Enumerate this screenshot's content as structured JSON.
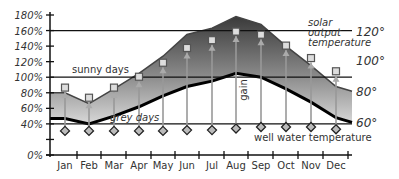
{
  "chart_data": {
    "type": "area",
    "title": "",
    "xlabel": "",
    "ylabel": "",
    "categories": [
      "Jan",
      "Feb",
      "Mar",
      "Apr",
      "May",
      "Jun",
      "Jul",
      "Aug",
      "Sep",
      "Oct",
      "Nov",
      "Dec"
    ],
    "ylim": [
      0,
      180
    ],
    "yticks": [
      "0%",
      "40%",
      "60%",
      "80%",
      "100%",
      "120%",
      "140%",
      "160%",
      "180%"
    ],
    "right_axis_ticks": [
      "60°",
      "80°",
      "100°",
      "120°"
    ],
    "series": [
      {
        "name": "sunny days",
        "values": [
          80,
          66,
          85,
          105,
          127,
          155,
          163,
          178,
          168,
          140,
          115,
          88
        ]
      },
      {
        "name": "grey days",
        "values": [
          47,
          40,
          50,
          62,
          76,
          88,
          95,
          105,
          100,
          85,
          68,
          48
        ]
      },
      {
        "name": "solar output temperature",
        "values": [
          86,
          73,
          86,
          100,
          118,
          137,
          147,
          158,
          154,
          140,
          124,
          107
        ]
      },
      {
        "name": "well water temperature",
        "values": [
          31,
          31,
          31,
          31,
          31,
          32,
          32,
          34,
          36,
          36,
          36,
          33
        ]
      }
    ],
    "reference_lines": [
      160,
      100,
      40
    ],
    "annotations": [
      "sunny days",
      "grey days",
      "solar output temperature",
      "well water temperature",
      "gain"
    ],
    "grid": false,
    "legend_position": "inline"
  }
}
